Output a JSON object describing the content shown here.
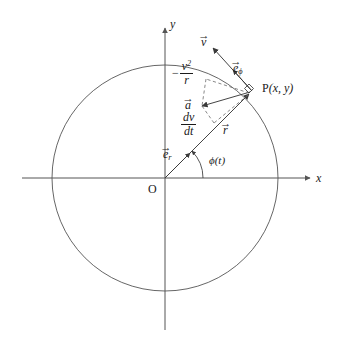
{
  "figure": {
    "kind": "vector-diagram",
    "background_color": "#ffffff",
    "stroke_color": "#3a3a3a",
    "text_color": "#1a1a1a"
  },
  "axes": {
    "x_label": "x",
    "y_label": "y",
    "origin_label": "O"
  },
  "point": {
    "label": "P(x, y)",
    "name_letter": "P",
    "coords_text": "(x, y)"
  },
  "vectors": {
    "velocity": {
      "symbol": "v",
      "accent": "→",
      "label": "v"
    },
    "unit_phi": {
      "symbol": "e",
      "subscript": "ϕ",
      "accent": "→",
      "label": "e_phi"
    },
    "unit_r": {
      "symbol": "e",
      "subscript": "r",
      "accent": "→",
      "label": "e_r"
    },
    "acceleration": {
      "symbol": "a",
      "accent": "→",
      "label": "a"
    },
    "radius": {
      "symbol": "r",
      "accent": "→",
      "label": "r"
    }
  },
  "components": {
    "centripetal": {
      "sign": "−",
      "numerator": "v",
      "numerator_exponent": "2",
      "denominator": "r",
      "plain": "-v^2/r"
    },
    "tangential": {
      "numerator": "dv",
      "denominator": "dt",
      "plain": "dv/dt"
    }
  },
  "angle": {
    "label_symbol": "ϕ",
    "label_arg": "(t)",
    "plain": "phi(t)",
    "value_degrees": 45
  },
  "geometry": {
    "center_x": 165,
    "center_y": 178,
    "radius": 113,
    "point_angle_degrees": 45,
    "arc_radius": 38
  }
}
